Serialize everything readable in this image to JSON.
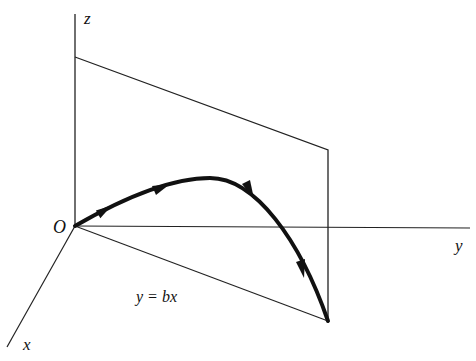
{
  "diagram": {
    "axes": {
      "z_label": "z",
      "y_label": "y",
      "x_label": "x",
      "origin_label": "O"
    },
    "plane_trace_label": "y = bx",
    "colors": {
      "line": "#222222",
      "curve": "#111111",
      "background": "#ffffff"
    }
  }
}
